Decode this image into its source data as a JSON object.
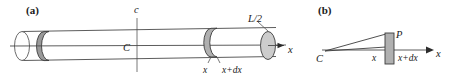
{
  "figure": {
    "title_text": "",
    "background_color": "#ffffff",
    "ink_color": "#1a1a1a"
  },
  "panels": [
    {
      "id": "panel-a",
      "label": "(a)",
      "description": "long cylindrical rod shown in perspective with central axis, mid-plane and a thin slab element",
      "labels": {
        "center_plane_top": "c",
        "center_point": "C",
        "half_length": "L/2",
        "slab_left": "x",
        "slab_right": "x+dx",
        "axis": "x"
      }
    },
    {
      "id": "panel-b",
      "label": "(b)",
      "description": "edge-on view of the rod axis with apex point C and slab element at P",
      "labels": {
        "apex": "C",
        "slab_point": "P",
        "slab_left": "x",
        "slab_right": "x+dx",
        "axis": "x"
      }
    }
  ],
  "colors": {
    "outline": "#4a4a4a",
    "slab_dark": "#9a9a9a",
    "slab_mid": "#b0b0b0",
    "cap_shaded": "#cccccc",
    "cap_open": "#ffffff"
  }
}
